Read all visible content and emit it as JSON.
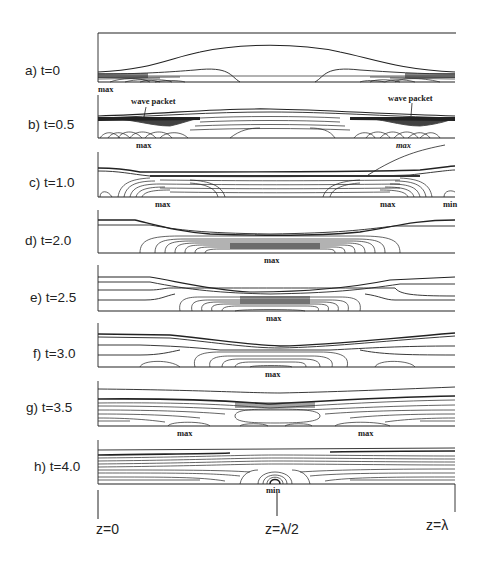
{
  "figure": {
    "panels": [
      {
        "id": "a",
        "label": "a) t=0"
      },
      {
        "id": "b",
        "label": "b) t=0.5"
      },
      {
        "id": "c",
        "label": "c) t=1.0"
      },
      {
        "id": "d",
        "label": "d) t=2.0"
      },
      {
        "id": "e",
        "label": "e) t=2.5"
      },
      {
        "id": "f",
        "label": "f) t=3.0"
      },
      {
        "id": "g",
        "label": "g) t=3.5"
      },
      {
        "id": "h",
        "label": "h) t=4.0"
      }
    ],
    "annotations": {
      "a_max": "max",
      "b_wave_left": "wave packet",
      "b_wave_right": "wave packet",
      "b_max_left": "max",
      "b_max_right": "max",
      "c_max_left": "max",
      "c_max_right": "max",
      "c_min": "min",
      "d_max": "max",
      "e_max": "max",
      "f_max": "max",
      "g_max_left": "max",
      "g_max_right": "max",
      "h_min": "min"
    },
    "x_axis": {
      "ticks": [
        "z=0",
        "z=λ/2",
        "z=λ"
      ]
    }
  }
}
